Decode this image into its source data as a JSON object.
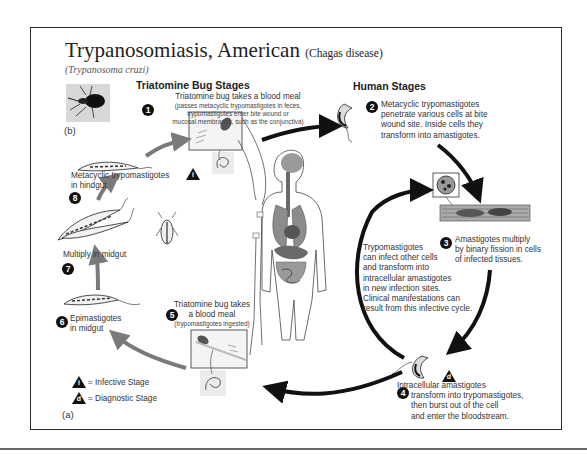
{
  "title": {
    "main": "Trypanosomiasis, American",
    "paren": "(Chagas disease)",
    "subtitle": "(Trypanosoma cruzi)"
  },
  "sections": {
    "bug_stages": "Triatomine Bug Stages",
    "human_stages": "Human Stages"
  },
  "stages": [
    {
      "num": "1",
      "title": "Triatomine bug takes a blood meal",
      "detail": [
        "(passes metacyclic trypomastigotes in feces,",
        "trypomastigotes enter bite wound or",
        "mucosal membranes, such as the conjunctiva)"
      ]
    },
    {
      "num": "2",
      "lines": [
        "Metacyclic trypomastigotes",
        "penetrate various cells at bite",
        "wound site.  Inside cells they",
        "transform into amastigotes."
      ]
    },
    {
      "num": "3",
      "lines": [
        "Amastigotes multiply",
        "by binary fission in cells",
        "of infected tissues."
      ]
    },
    {
      "num": "4",
      "lines": [
        "Intracellular amastigotes",
        "transform into trypomastigotes,",
        "then burst out of the cell",
        "and enter the bloodstream."
      ]
    },
    {
      "num": "5",
      "lines": [
        "Triatomine bug takes",
        "a blood meal"
      ],
      "detail": "(trypomastigotes ingested)"
    },
    {
      "num": "6",
      "lines": [
        "Epimastigotes",
        "in midgut"
      ]
    },
    {
      "num": "7",
      "lines": [
        "Multiply in midgut"
      ]
    },
    {
      "num": "8",
      "lines": [
        "Metacyclic trypomastigotes",
        "in hindgut"
      ]
    }
  ],
  "inner_cycle_text": [
    "Trypomastigotes",
    "can infect other cells",
    "and transform into",
    "intracellular amastigotes",
    "in new infection sites.",
    "Clinical manifestations can",
    "result from this infective cycle."
  ],
  "legend": {
    "infective": {
      "symbol": "i",
      "label": "= Infective Stage"
    },
    "diagnostic": {
      "symbol": "d",
      "label": "= Diagnostic Stage"
    }
  },
  "panel_labels": {
    "a": "(a)",
    "b": "(b)"
  },
  "colors": {
    "arrow_dark": "#111111",
    "arrow_grey": "#7a7a7a",
    "frame": "#2a2a2a",
    "organ_grey": "#8c8c8c"
  }
}
